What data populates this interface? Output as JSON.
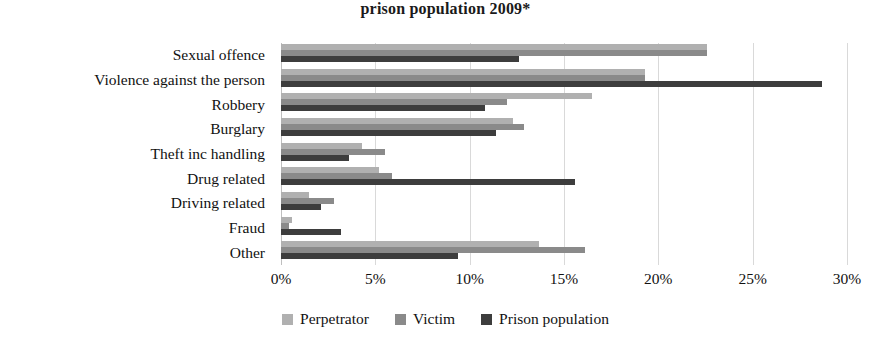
{
  "chart_data": {
    "type": "bar",
    "orientation": "horizontal",
    "title": "prison population 2009*",
    "xlabel": "",
    "ylabel": "",
    "xlim": [
      0,
      30
    ],
    "xticks": [
      0,
      5,
      10,
      15,
      20,
      25,
      30
    ],
    "xtick_labels": [
      "0%",
      "5%",
      "10%",
      "15%",
      "20%",
      "25%",
      "30%"
    ],
    "grid": true,
    "legend_position": "bottom",
    "categories": [
      "Sexual offence",
      "Violence against the person",
      "Robbery",
      "Burglary",
      "Theft inc handling",
      "Drug related",
      "Driving related",
      "Fraud",
      "Other"
    ],
    "series": [
      {
        "name": "Perpetrator",
        "color": "#b0b0b0",
        "values": [
          22.6,
          19.3,
          16.5,
          12.3,
          4.3,
          5.2,
          1.5,
          0.6,
          13.7
        ]
      },
      {
        "name": "Victim",
        "color": "#8a8a8a",
        "values": [
          22.6,
          19.3,
          12.0,
          12.9,
          5.5,
          5.9,
          2.8,
          0.4,
          16.1
        ]
      },
      {
        "name": "Prison population",
        "color": "#3d3d3d",
        "values": [
          12.6,
          28.7,
          10.8,
          11.4,
          3.6,
          15.6,
          2.1,
          3.2,
          9.4
        ]
      }
    ]
  },
  "legend": {
    "items": [
      {
        "label": "Perpetrator",
        "color": "#b0b0b0"
      },
      {
        "label": "Victim",
        "color": "#8a8a8a"
      },
      {
        "label": "Prison population",
        "color": "#3d3d3d"
      }
    ]
  }
}
